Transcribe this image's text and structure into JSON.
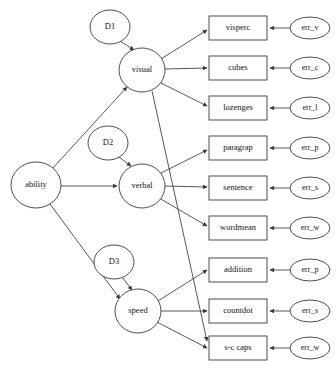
{
  "diagram": {
    "type": "path-diagram",
    "colors": {
      "stroke": "#3a3a3a",
      "fill": "#ffffff",
      "text": "#141414",
      "background": "#ffffff"
    },
    "latent_nodes": [
      {
        "id": "ability",
        "label": "ability",
        "cx": 36,
        "cy": 185,
        "rx": 25,
        "ry": 23
      },
      {
        "id": "visual",
        "label": "visual",
        "cx": 142,
        "cy": 70,
        "rx": 23,
        "ry": 22
      },
      {
        "id": "verbal",
        "label": "verbal",
        "cx": 142,
        "cy": 186,
        "rx": 23,
        "ry": 22
      },
      {
        "id": "speed",
        "label": "speed",
        "cx": 138,
        "cy": 311,
        "rx": 23,
        "ry": 22
      }
    ],
    "disturbance_nodes": [
      {
        "id": "D1",
        "label": "D1",
        "cx": 110,
        "cy": 27,
        "rx": 20,
        "ry": 17
      },
      {
        "id": "D2",
        "label": "D2",
        "cx": 108,
        "cy": 143,
        "rx": 20,
        "ry": 17
      },
      {
        "id": "D3",
        "label": "D3",
        "cx": 114,
        "cy": 262,
        "rx": 20,
        "ry": 17
      }
    ],
    "observed_nodes": [
      {
        "id": "visperc",
        "label": "visperc",
        "x": 209,
        "y": 16,
        "w": 58,
        "h": 24
      },
      {
        "id": "cubes",
        "label": "cubes",
        "x": 209,
        "y": 56,
        "w": 58,
        "h": 24
      },
      {
        "id": "lozenges",
        "label": "lozenges",
        "x": 209,
        "y": 96,
        "w": 58,
        "h": 24
      },
      {
        "id": "paragrap",
        "label": "paragrap",
        "x": 209,
        "y": 136,
        "w": 58,
        "h": 24
      },
      {
        "id": "sentence",
        "label": "sentence",
        "x": 209,
        "y": 176,
        "w": 58,
        "h": 24
      },
      {
        "id": "wordmean",
        "label": "wordmean",
        "x": 209,
        "y": 216,
        "w": 58,
        "h": 24
      },
      {
        "id": "addition",
        "label": "addition",
        "x": 209,
        "y": 258,
        "w": 58,
        "h": 24
      },
      {
        "id": "countdot",
        "label": "countdot",
        "x": 209,
        "y": 299,
        "w": 58,
        "h": 24
      },
      {
        "id": "s-c-caps",
        "label": "s-c caps",
        "x": 209,
        "y": 336,
        "w": 58,
        "h": 24
      }
    ],
    "error_nodes": [
      {
        "id": "err_v",
        "label": "err_v",
        "cx": 310,
        "cy": 28,
        "rx": 20,
        "ry": 11
      },
      {
        "id": "err_c",
        "label": "err_c",
        "cx": 310,
        "cy": 68,
        "rx": 20,
        "ry": 11
      },
      {
        "id": "err_l",
        "label": "err_l",
        "cx": 310,
        "cy": 108,
        "rx": 20,
        "ry": 11
      },
      {
        "id": "err_p1",
        "label": "err_p",
        "cx": 310,
        "cy": 148,
        "rx": 20,
        "ry": 11
      },
      {
        "id": "err_s1",
        "label": "err_s",
        "cx": 310,
        "cy": 188,
        "rx": 20,
        "ry": 11
      },
      {
        "id": "err_w1",
        "label": "err_w",
        "cx": 310,
        "cy": 228,
        "rx": 20,
        "ry": 11
      },
      {
        "id": "err_p2",
        "label": "err_p",
        "cx": 310,
        "cy": 270,
        "rx": 20,
        "ry": 11
      },
      {
        "id": "err_s2",
        "label": "err_s",
        "cx": 310,
        "cy": 311,
        "rx": 20,
        "ry": 11
      },
      {
        "id": "err_w2",
        "label": "err_w",
        "cx": 310,
        "cy": 348,
        "rx": 20,
        "ry": 11
      }
    ],
    "edges": [
      {
        "from": "ability",
        "to": "visual",
        "x1": 52,
        "y1": 169,
        "x2": 127,
        "y2": 87
      },
      {
        "from": "ability",
        "to": "verbal",
        "x1": 61,
        "y1": 186,
        "x2": 117,
        "y2": 186
      },
      {
        "from": "ability",
        "to": "speed",
        "x1": 50,
        "y1": 204,
        "x2": 120,
        "y2": 299
      },
      {
        "from": "D1",
        "to": "visual",
        "x1": 120,
        "y1": 41,
        "x2": 134,
        "y2": 50
      },
      {
        "from": "D2",
        "to": "verbal",
        "x1": 119,
        "y1": 157,
        "x2": 131,
        "y2": 166
      },
      {
        "from": "D3",
        "to": "speed",
        "x1": 122,
        "y1": 277,
        "x2": 132,
        "y2": 290
      },
      {
        "from": "visual",
        "to": "visperc",
        "x1": 161,
        "y1": 59,
        "x2": 207,
        "y2": 30
      },
      {
        "from": "visual",
        "to": "cubes",
        "x1": 165,
        "y1": 69,
        "x2": 207,
        "y2": 68
      },
      {
        "from": "visual",
        "to": "lozenges",
        "x1": 161,
        "y1": 83,
        "x2": 207,
        "y2": 106
      },
      {
        "from": "visual",
        "to": "s-c-caps",
        "x1": 152,
        "y1": 91,
        "x2": 207,
        "y2": 341
      },
      {
        "from": "verbal",
        "to": "paragrap",
        "x1": 159,
        "y1": 174,
        "x2": 207,
        "y2": 150
      },
      {
        "from": "verbal",
        "to": "sentence",
        "x1": 165,
        "y1": 186,
        "x2": 207,
        "y2": 187
      },
      {
        "from": "verbal",
        "to": "wordmean",
        "x1": 159,
        "y1": 198,
        "x2": 207,
        "y2": 226
      },
      {
        "from": "speed",
        "to": "addition",
        "x1": 158,
        "y1": 301,
        "x2": 207,
        "y2": 270
      },
      {
        "from": "speed",
        "to": "countdot",
        "x1": 161,
        "y1": 311,
        "x2": 207,
        "y2": 311
      },
      {
        "from": "speed",
        "to": "s-c-caps",
        "x1": 157,
        "y1": 322,
        "x2": 207,
        "y2": 348
      },
      {
        "from": "err_v",
        "to": "visperc",
        "x1": 290,
        "y1": 28,
        "x2": 270,
        "y2": 28
      },
      {
        "from": "err_c",
        "to": "cubes",
        "x1": 290,
        "y1": 68,
        "x2": 270,
        "y2": 68
      },
      {
        "from": "err_l",
        "to": "lozenges",
        "x1": 290,
        "y1": 108,
        "x2": 270,
        "y2": 108
      },
      {
        "from": "err_p1",
        "to": "paragrap",
        "x1": 290,
        "y1": 148,
        "x2": 270,
        "y2": 148
      },
      {
        "from": "err_s1",
        "to": "sentence",
        "x1": 290,
        "y1": 188,
        "x2": 270,
        "y2": 188
      },
      {
        "from": "err_w1",
        "to": "wordmean",
        "x1": 290,
        "y1": 228,
        "x2": 270,
        "y2": 228
      },
      {
        "from": "err_p2",
        "to": "addition",
        "x1": 290,
        "y1": 270,
        "x2": 270,
        "y2": 270
      },
      {
        "from": "err_s2",
        "to": "countdot",
        "x1": 290,
        "y1": 311,
        "x2": 270,
        "y2": 311
      },
      {
        "from": "err_w2",
        "to": "s-c-caps",
        "x1": 290,
        "y1": 348,
        "x2": 270,
        "y2": 348
      }
    ]
  }
}
